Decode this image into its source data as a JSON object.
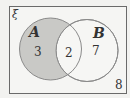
{
  "diagram": {
    "type": "venn",
    "universal_symbol": "ξ",
    "sets": [
      {
        "name": "A",
        "only_count": "3",
        "shaded": true
      },
      {
        "name": "B",
        "only_count": "7",
        "shaded": false
      }
    ],
    "intersection_count": "2",
    "outside_count": "8",
    "colors": {
      "background": "#f2f2f0",
      "shaded_fill": "#c9c9c6",
      "unshaded_fill": "#f4f4f2",
      "stroke": "#8a8a8a",
      "frame": "#6a6a6a",
      "text": "#333333"
    }
  }
}
